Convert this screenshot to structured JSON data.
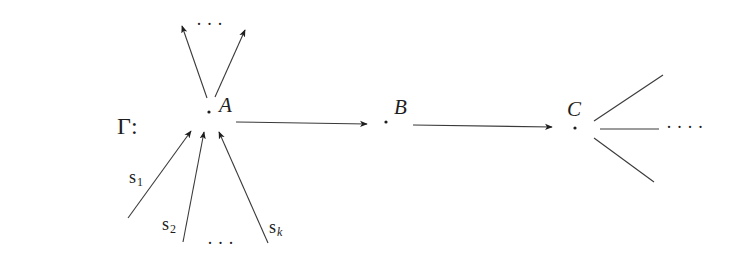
{
  "graph": {
    "name": "Γ:",
    "nodes": [
      {
        "id": "A",
        "label": "A"
      },
      {
        "id": "B",
        "label": "B"
      },
      {
        "id": "C",
        "label": "C"
      }
    ],
    "edges": [
      {
        "from": "A",
        "to": "B"
      },
      {
        "from": "B",
        "to": "C"
      }
    ],
    "incoming_to_A": {
      "labels": [
        "s",
        "s",
        "s"
      ],
      "subscripts": [
        "1",
        "2",
        "k"
      ],
      "ellipsis": "· · ·"
    },
    "outgoing_from_A_ellipsis": "· · ·",
    "outgoing_from_C_ellipsis": "· · · ·"
  }
}
